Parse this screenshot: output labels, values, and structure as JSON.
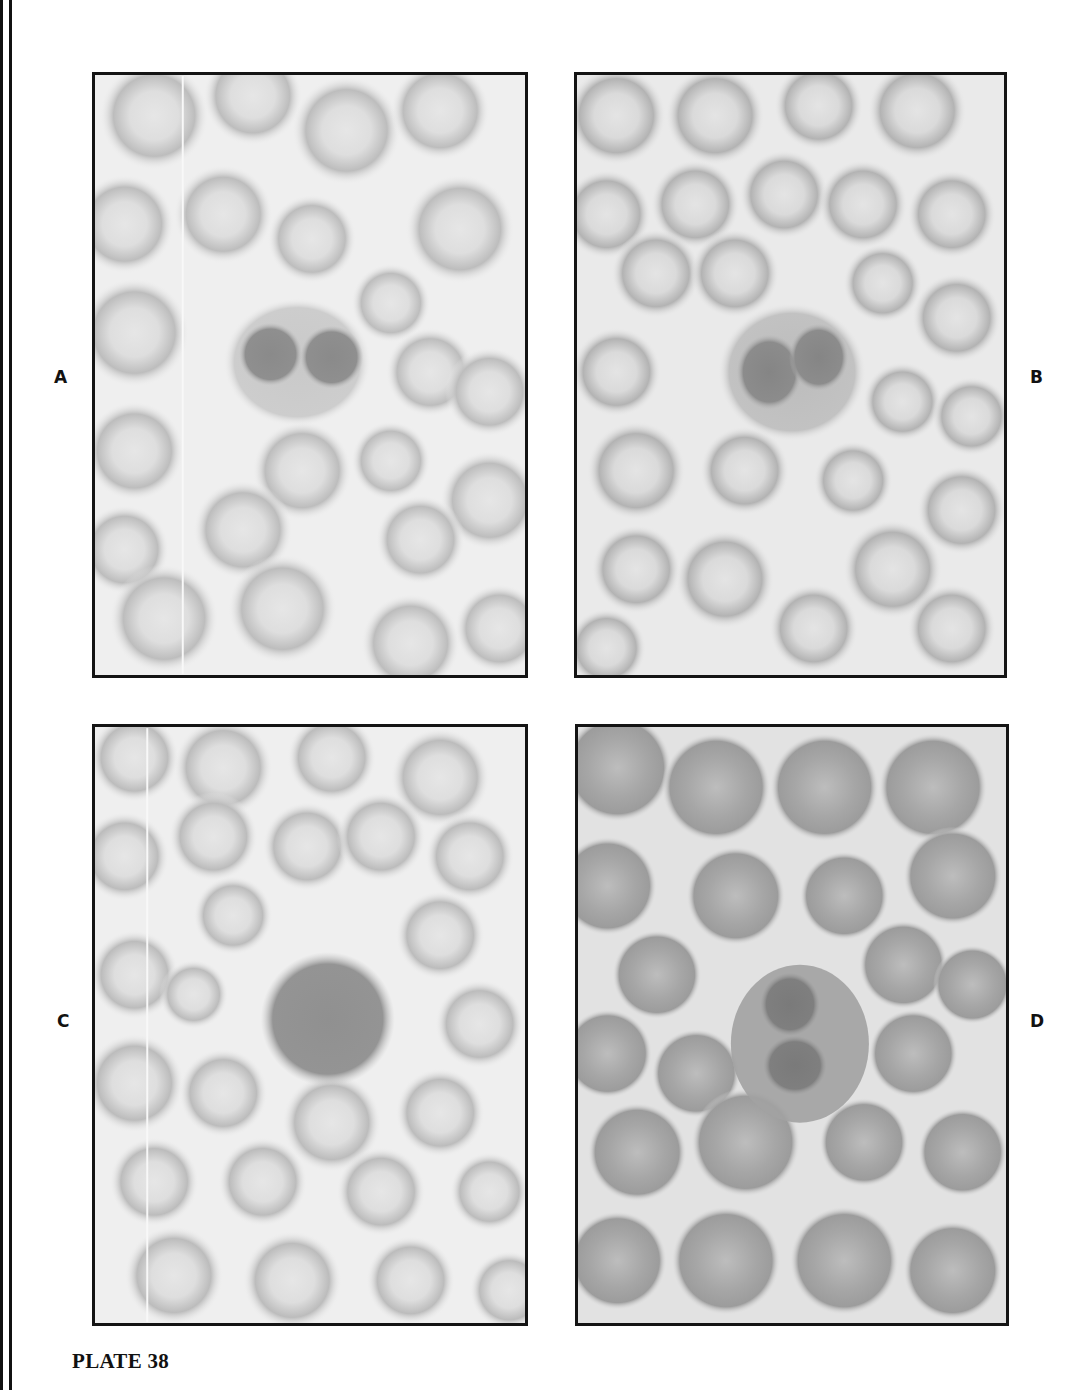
{
  "plate": {
    "caption": "PLATE 38",
    "panels": [
      {
        "id": "A",
        "label": "A",
        "description": "Blood smear: cell with two round dark nuclear lobes among erythrocytes"
      },
      {
        "id": "B",
        "label": "B",
        "description": "Blood smear: bilobed nucleated cell among erythrocytes"
      },
      {
        "id": "C",
        "label": "C",
        "description": "Blood smear: large round cell with dense nucleus among erythrocytes"
      },
      {
        "id": "D",
        "label": "D",
        "description": "Blood smear: crowded erythrocytes around a bilobed nucleated cell"
      }
    ]
  },
  "colors": {
    "border": "#141414",
    "background": "#ffffff",
    "rbc_rim": "#a8a8a8",
    "rbc_center": "#dcdcdc",
    "nucleus": "#7d7d7d"
  }
}
